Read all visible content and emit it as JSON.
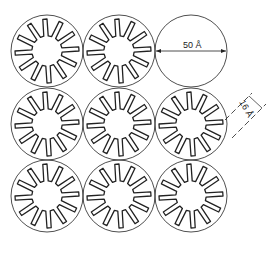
{
  "diagram": {
    "grid": {
      "rows": 3,
      "cols": 3,
      "centers_x": [
        47,
        119,
        191
      ],
      "centers_y": [
        51,
        124,
        196
      ],
      "radius": 36
    },
    "folds_per_particle": 12,
    "empty_particle": {
      "row": 0,
      "col": 2
    },
    "annotations": {
      "diameter": "50 Å",
      "spacing": "16 Å"
    },
    "colors": {
      "stroke": "#222222",
      "background": "#ffffff"
    }
  }
}
